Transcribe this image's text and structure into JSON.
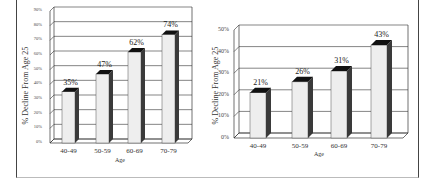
{
  "chart_data": [
    {
      "type": "bar",
      "title": "",
      "xlabel": "Age",
      "ylabel": "% Decline From Age 25",
      "categories": [
        "40-49",
        "50-59",
        "60-69",
        "70-79"
      ],
      "values": [
        35,
        47,
        62,
        74
      ],
      "value_labels": [
        "35%",
        "47%",
        "62%",
        "74%"
      ],
      "yticks": [
        "0%",
        "10%",
        "20%",
        "30%",
        "40%",
        "50%",
        "60%",
        "70%",
        "80%",
        "90%"
      ],
      "ylim": [
        0,
        90
      ],
      "grid": true
    },
    {
      "type": "bar",
      "title": "",
      "xlabel": "Age",
      "ylabel": "% Decline From Age 25",
      "categories": [
        "40-49",
        "50-59",
        "60-69",
        "70-79"
      ],
      "values": [
        21,
        26,
        31,
        43
      ],
      "value_labels": [
        "21%",
        "26%",
        "31%",
        "43%"
      ],
      "yticks": [
        "0%",
        "10%",
        "20%",
        "30%",
        "40%",
        "50%"
      ],
      "ylim": [
        0,
        50
      ],
      "grid": true
    }
  ],
  "colors": {
    "bar_front": "#eeeeee",
    "bar_side": "#3a3a3a",
    "bar_top": "#111111",
    "grid": "#333333"
  }
}
